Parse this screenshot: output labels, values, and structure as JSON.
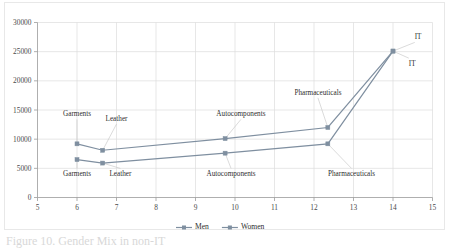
{
  "chart_data": {
    "type": "line",
    "title": "",
    "subtitle": "",
    "xlabel": "",
    "ylabel": "",
    "xlim": [
      5,
      15
    ],
    "ylim": [
      0,
      30000
    ],
    "x_ticks": [
      5,
      6,
      7,
      8,
      9,
      10,
      11,
      12,
      13,
      14,
      15
    ],
    "y_ticks": [
      0,
      5000,
      10000,
      15000,
      20000,
      25000,
      30000
    ],
    "x_tick_labels": [
      "5",
      "6",
      "7",
      "8",
      "9",
      "10",
      "11",
      "12",
      "13",
      "14",
      "15"
    ],
    "y_tick_labels": [
      "0",
      "5000",
      "10000",
      "15000",
      "20000",
      "25000",
      "30000"
    ],
    "grid": true,
    "legend_position": "bottom",
    "point_categories": [
      "Garments",
      "Leather",
      "Autocomponents",
      "Pharmaceuticals",
      "IT"
    ],
    "x": [
      6.0,
      6.65,
      9.75,
      12.35,
      14.0
    ],
    "series": [
      {
        "name": "Men",
        "color": "#7f8fa0",
        "marker": "square",
        "values": [
          6500,
          5900,
          7600,
          9200,
          25100
        ]
      },
      {
        "name": "Women",
        "color": "#7f8fa0",
        "marker": "square",
        "values": [
          9200,
          8100,
          10100,
          12000,
          25100
        ]
      }
    ],
    "annotations": [
      {
        "text": "Garments",
        "label_x": 6.0,
        "label_y": 13900,
        "point_x": 6.0,
        "point_y": 9200,
        "anchor": "mid",
        "series": "Women"
      },
      {
        "text": "Leather",
        "label_x": 7.0,
        "label_y": 13100,
        "point_x": 6.65,
        "point_y": 8100,
        "anchor": "mid",
        "series": "Women"
      },
      {
        "text": "Autocomponents",
        "label_x": 10.15,
        "label_y": 13900,
        "point_x": 9.75,
        "point_y": 10100,
        "anchor": "mid",
        "series": "Women"
      },
      {
        "text": "Pharmaceuticals",
        "label_x": 12.1,
        "label_y": 17600,
        "point_x": 12.35,
        "point_y": 12000,
        "anchor": "mid",
        "series": "Women"
      },
      {
        "text": "IT",
        "label_x": 14.55,
        "label_y": 27100,
        "point_x": 14.0,
        "point_y": 25100,
        "anchor": "start",
        "series": "Women"
      },
      {
        "text": "Garments",
        "label_x": 6.0,
        "label_y": 3700,
        "point_x": 6.0,
        "point_y": 6500,
        "anchor": "mid",
        "series": "Men"
      },
      {
        "text": "Leather",
        "label_x": 7.1,
        "label_y": 3700,
        "point_x": 6.65,
        "point_y": 5900,
        "anchor": "mid",
        "series": "Men"
      },
      {
        "text": "Autocomponents",
        "label_x": 9.9,
        "label_y": 3700,
        "point_x": 9.75,
        "point_y": 7600,
        "anchor": "mid",
        "series": "Men"
      },
      {
        "text": "Pharmaceuticals",
        "label_x": 12.95,
        "label_y": 3700,
        "point_x": 12.35,
        "point_y": 9200,
        "anchor": "mid",
        "series": "Men"
      },
      {
        "text": "IT",
        "label_x": 14.4,
        "label_y": 22600,
        "point_x": 14.0,
        "point_y": 25100,
        "anchor": "start",
        "series": "Men"
      }
    ]
  },
  "legend": {
    "entries": [
      {
        "label": "Men",
        "color": "#7f8fa0"
      },
      {
        "label": "Women",
        "color": "#7f8fa0"
      }
    ]
  },
  "caption": {
    "text": "Figure 10. Gender Mix in non-IT"
  }
}
